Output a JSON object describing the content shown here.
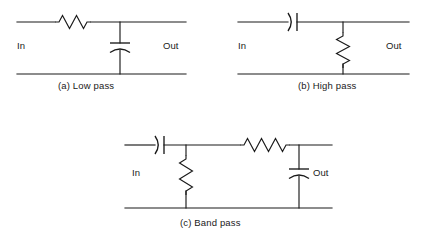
{
  "figure": {
    "kind": "circuit-diagram",
    "background_color": "#ffffff",
    "line_color": "#1a1a1a",
    "panels": [
      {
        "id": "low-pass",
        "caption": "(a)  Low pass",
        "caption_index": "(a)",
        "caption_text": "Low pass",
        "in_label": "In",
        "out_label": "Out",
        "topology": "series resistor, shunt capacitor",
        "components": [
          {
            "type": "resistor",
            "orientation": "horizontal",
            "branch": "series",
            "symbol": "zigzag"
          },
          {
            "type": "capacitor",
            "orientation": "vertical",
            "branch": "shunt",
            "symbol": "flat-plate-over-curved-plate"
          }
        ]
      },
      {
        "id": "high-pass",
        "caption": "(b)  High pass",
        "caption_index": "(b)",
        "caption_text": "High pass",
        "in_label": "In",
        "out_label": "Out",
        "topology": "series capacitor, shunt resistor",
        "components": [
          {
            "type": "capacitor",
            "orientation": "horizontal",
            "branch": "series",
            "symbol": "curved-plate-then-flat-plate"
          },
          {
            "type": "resistor",
            "orientation": "vertical",
            "branch": "shunt",
            "symbol": "zigzag"
          }
        ]
      },
      {
        "id": "band-pass",
        "caption": "(c)  Band pass",
        "caption_index": "(c)",
        "caption_text": "Band pass",
        "in_label": "In",
        "out_label": "Out",
        "topology": "series capacitor, shunt resistor, series resistor, shunt capacitor",
        "components": [
          {
            "type": "capacitor",
            "orientation": "horizontal",
            "branch": "series",
            "symbol": "curved-plate-then-flat-plate"
          },
          {
            "type": "resistor",
            "orientation": "vertical",
            "branch": "shunt",
            "symbol": "zigzag"
          },
          {
            "type": "resistor",
            "orientation": "horizontal",
            "branch": "series",
            "symbol": "zigzag"
          },
          {
            "type": "capacitor",
            "orientation": "vertical",
            "branch": "shunt",
            "symbol": "flat-plate-over-curved-plate"
          }
        ]
      }
    ]
  }
}
